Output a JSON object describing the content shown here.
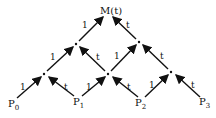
{
  "diagram": {
    "title": "M(t)",
    "points": [
      {
        "name": "P",
        "sub": "0"
      },
      {
        "name": "P",
        "sub": "1"
      },
      {
        "name": "P",
        "sub": "2"
      },
      {
        "name": "P",
        "sub": "3"
      }
    ],
    "edge_labels": {
      "one": "1",
      "t": "t"
    },
    "colors": {
      "ink": "#111111",
      "background": "#ffffff"
    }
  }
}
